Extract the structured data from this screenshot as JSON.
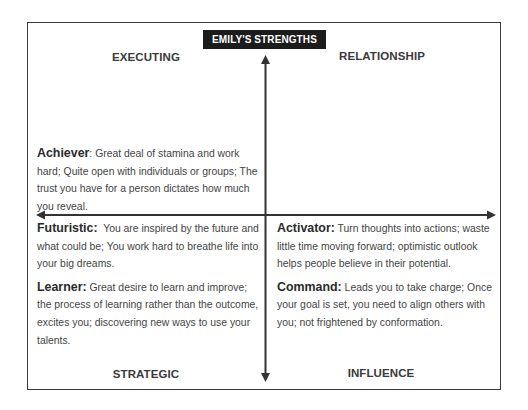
{
  "title": "EMILY'S STRENGTHS",
  "quadrants": {
    "top_left": "EXECUTING",
    "top_right": "RELATIONSHIP",
    "bottom_left": "STRATEGIC",
    "bottom_right": "INFLUENCE"
  },
  "strengths": {
    "achiever": {
      "term": "Achiever",
      "sep": ": ",
      "description": "Great deal of stamina and work hard; Quite open with individuals or groups; The trust you have for a person dictates how much you reveal."
    },
    "futuristic": {
      "term": "Futuristic:",
      "sep": "  ",
      "description": "You are inspired by the future and what could be; You work hard to breathe life into your big dreams."
    },
    "learner": {
      "term": "Learner:",
      "sep": " ",
      "description": "Great desire to learn and improve; the process of learning rather than the outcome, excites you; discovering new ways to use your talents."
    },
    "activator": {
      "term": "Activator:",
      "sep": " ",
      "description": "Turn thoughts into actions; waste little time moving forward; optimistic outlook helps people believe in their potential."
    },
    "command": {
      "term": "Command:",
      "sep": " ",
      "description": "Leads you to take charge; Once your goal is set, you need to align others with you; not frightened by conformation."
    }
  },
  "colors": {
    "title_bg": "#1c1c1c",
    "title_text": "#ffffff",
    "lines": "#333333",
    "text": "#3a3a3a"
  }
}
